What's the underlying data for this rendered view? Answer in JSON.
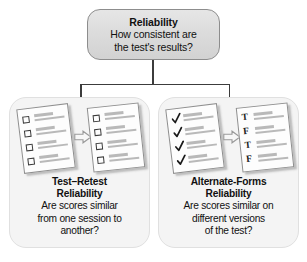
{
  "diagram": {
    "root": {
      "title": "Reliability",
      "question_line1": "How consistent are",
      "question_line2": "the test's results?"
    },
    "branches": [
      {
        "id": "test-retest",
        "title_line1": "Test–Retest",
        "title_line2": "Reliability",
        "desc_line1": "Are scores similar",
        "desc_line2": "from one session to",
        "desc_line3": "another?",
        "artwork": {
          "type": "two-sheets-with-arrow",
          "arrow_icon": "block-arrow-right-icon",
          "sheet_left": {
            "label": "blank-checklist",
            "marks": [
              "checkbox-empty",
              "checkbox-empty",
              "checkbox-empty",
              "checkbox-empty"
            ]
          },
          "sheet_right": {
            "label": "blank-checklist",
            "marks": [
              "checkbox-empty",
              "checkbox-empty",
              "checkbox-empty",
              "checkbox-empty"
            ]
          }
        }
      },
      {
        "id": "alternate-forms",
        "title_line1": "Alternate-Forms",
        "title_line2": "Reliability",
        "desc_line1": "Are scores similar on",
        "desc_line2": "different versions",
        "desc_line3": "of the test?",
        "artwork": {
          "type": "two-sheets-with-arrow",
          "arrow_icon": "block-arrow-right-icon",
          "sheet_left": {
            "label": "checked-checklist",
            "marks": [
              "check",
              "check",
              "check",
              "check"
            ]
          },
          "sheet_right": {
            "label": "true-false-checklist",
            "marks": [
              "T",
              "F",
              "T",
              "F"
            ]
          }
        }
      }
    ],
    "colors": {
      "root_fill": "#dcdcdc",
      "root_border": "#8d8d8d",
      "panel_fill": "#f4f4f4",
      "panel_border": "#e0e0e0",
      "connector": "#3c3c3c",
      "sheet_fill": "#fdfdfd",
      "sheet_border": "#8f8f8f",
      "text_line": "#b9b9b9",
      "text": "#111111"
    }
  }
}
